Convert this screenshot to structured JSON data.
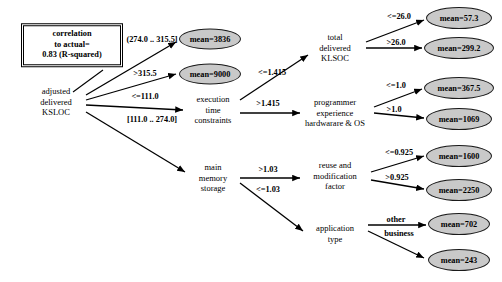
{
  "figure": {
    "type": "decision-tree-diagram",
    "background": "#ffffff",
    "leaf_fill": "#c9c9c9",
    "stroke": "#000000"
  },
  "info_box": {
    "name": "correlation-box",
    "lines": [
      "correlation",
      "to actual=",
      "0.83 (R-squared)"
    ],
    "x": 72,
    "y": 45,
    "width": 98,
    "height": 40
  },
  "nodes": [
    {
      "id": "root",
      "lines": [
        "adjusted",
        "delivered",
        "KSLOC"
      ],
      "x": 56,
      "y": 102
    },
    {
      "id": "exec",
      "lines": [
        "execution",
        "time",
        "constraints"
      ],
      "x": 213,
      "y": 110
    },
    {
      "id": "mem",
      "lines": [
        "main",
        "memory",
        "storage"
      ],
      "x": 213,
      "y": 178
    },
    {
      "id": "total",
      "lines": [
        "total",
        "delivered",
        "KLSOC"
      ],
      "x": 335,
      "y": 48
    },
    {
      "id": "prog",
      "lines": [
        "programmer",
        "experience",
        "hardwarare & OS"
      ],
      "x": 335,
      "y": 113
    },
    {
      "id": "reuse",
      "lines": [
        "reuse and",
        "modification",
        "factor"
      ],
      "x": 335,
      "y": 176
    },
    {
      "id": "apptype",
      "lines": [
        "application",
        "type"
      ],
      "x": 335,
      "y": 233
    }
  ],
  "leaves": [
    {
      "id": "l-3836",
      "label": "mean=3836",
      "x": 210,
      "y": 39,
      "width": 62,
      "height": 21
    },
    {
      "id": "l-9000",
      "label": "mean=9000",
      "x": 210,
      "y": 74,
      "width": 62,
      "height": 21
    },
    {
      "id": "l-57",
      "label": "mean=57.3",
      "x": 459,
      "y": 18,
      "width": 66,
      "height": 22
    },
    {
      "id": "l-299",
      "label": "mean=299.2",
      "x": 459,
      "y": 48,
      "width": 70,
      "height": 22
    },
    {
      "id": "l-367",
      "label": "mean=367.5",
      "x": 459,
      "y": 88,
      "width": 70,
      "height": 22
    },
    {
      "id": "l-1069",
      "label": "mean=1069",
      "x": 459,
      "y": 119,
      "width": 66,
      "height": 22
    },
    {
      "id": "l-1600",
      "label": "mean=1600",
      "x": 459,
      "y": 156,
      "width": 66,
      "height": 22
    },
    {
      "id": "l-2250",
      "label": "mean=2250",
      "x": 459,
      "y": 190,
      "width": 66,
      "height": 22
    },
    {
      "id": "l-702",
      "label": "mean=702",
      "x": 459,
      "y": 224,
      "width": 62,
      "height": 22
    },
    {
      "id": "l-243",
      "label": "mean=243",
      "x": 459,
      "y": 260,
      "width": 62,
      "height": 22
    }
  ],
  "edges": [
    {
      "id": "e1",
      "from": "root",
      "to": "l-3836",
      "label": "(274.0 .. 315.5]",
      "lx": 152,
      "ly": 39,
      "x1": 86,
      "y1": 95,
      "x2": 176,
      "y2": 42
    },
    {
      "id": "e2",
      "from": "root",
      "to": "l-9000",
      "label": ">315.5",
      "lx": 145,
      "ly": 73,
      "x1": 86,
      "y1": 100,
      "x2": 176,
      "y2": 74
    },
    {
      "id": "e3",
      "from": "root",
      "to": "exec",
      "label": "<=111.0",
      "lx": 145,
      "ly": 96,
      "x1": 86,
      "y1": 105,
      "x2": 183,
      "y2": 110
    },
    {
      "id": "e4",
      "from": "root",
      "to": "mem",
      "label": "[111.0 .. 274.0]",
      "lx": 152,
      "ly": 119,
      "x1": 86,
      "y1": 112,
      "x2": 185,
      "y2": 172
    },
    {
      "id": "e5",
      "from": "exec",
      "to": "total",
      "label": "<=1.415",
      "lx": 272,
      "ly": 72,
      "x1": 240,
      "y1": 100,
      "x2": 308,
      "y2": 55
    },
    {
      "id": "e6",
      "from": "exec",
      "to": "prog",
      "label": ">1.415",
      "lx": 268,
      "ly": 103,
      "x1": 240,
      "y1": 113,
      "x2": 300,
      "y2": 113
    },
    {
      "id": "e7",
      "from": "mem",
      "to": "reuse",
      "label": ">1.03",
      "lx": 268,
      "ly": 169,
      "x1": 240,
      "y1": 178,
      "x2": 300,
      "y2": 178
    },
    {
      "id": "e8",
      "from": "mem",
      "to": "apptype",
      "label": "<=1.03",
      "lx": 268,
      "ly": 189,
      "x1": 240,
      "y1": 183,
      "x2": 303,
      "y2": 231
    },
    {
      "id": "e9",
      "from": "total",
      "to": "l-57",
      "label": "<=26.0",
      "lx": 399,
      "ly": 16,
      "x1": 366,
      "y1": 42,
      "x2": 424,
      "y2": 20
    },
    {
      "id": "e10",
      "from": "total",
      "to": "l-299",
      "label": ">26.0",
      "lx": 396,
      "ly": 42,
      "x1": 366,
      "y1": 48,
      "x2": 422,
      "y2": 48
    },
    {
      "id": "e11",
      "from": "prog",
      "to": "l-367",
      "label": "<=1.0",
      "lx": 396,
      "ly": 85,
      "x1": 374,
      "y1": 107,
      "x2": 422,
      "y2": 89
    },
    {
      "id": "e12",
      "from": "prog",
      "to": "l-1069",
      "label": ">1.0",
      "lx": 394,
      "ly": 109,
      "x1": 374,
      "y1": 113,
      "x2": 424,
      "y2": 118
    },
    {
      "id": "e13",
      "from": "reuse",
      "to": "l-1600",
      "label": "<=0.925",
      "lx": 399,
      "ly": 152,
      "x1": 371,
      "y1": 172,
      "x2": 424,
      "y2": 156
    },
    {
      "id": "e14",
      "from": "reuse",
      "to": "l-2250",
      "label": ">0.925",
      "lx": 397,
      "ly": 177,
      "x1": 371,
      "y1": 180,
      "x2": 424,
      "y2": 189
    },
    {
      "id": "e15",
      "from": "apptype",
      "to": "l-702",
      "label": "other",
      "lx": 396,
      "ly": 219,
      "x1": 368,
      "y1": 225,
      "x2": 426,
      "y2": 225
    },
    {
      "id": "e16",
      "from": "apptype",
      "to": "l-243",
      "label": "business",
      "lx": 399,
      "ly": 233,
      "x1": 368,
      "y1": 231,
      "x2": 424,
      "y2": 258
    }
  ],
  "info_connector": {
    "x1": 103,
    "y1": 70,
    "x2": 73,
    "y2": 92
  }
}
